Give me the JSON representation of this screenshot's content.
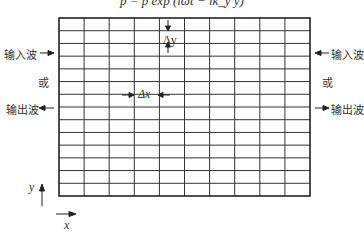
{
  "formula": "p = p̂ exp (iωt − ik_y y)",
  "grid": {
    "columns": 10,
    "rows": 14,
    "left": 59,
    "top": 18,
    "right": 310,
    "bottom": 196
  },
  "labels": {
    "left_input": "输入波",
    "left_or": "或",
    "left_output": "输出波",
    "right_input": "输入波",
    "right_or": "或",
    "right_output": "输出波",
    "delta_y": "Δy",
    "delta_x": "Δx",
    "axis_y": "y",
    "axis_x": "x"
  }
}
